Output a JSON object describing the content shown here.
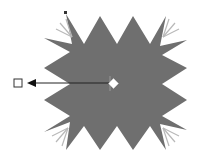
{
  "diagram": {
    "shape": {
      "type": "star-burst",
      "fill": "#6f6f6f",
      "points": "66,14 84,44 100,16 117,44 133,16 150,44 166,16 160,46 187,40 162,55 187,68 162,84 187,100 162,116 187,130 160,124 166,150 150,126 133,150 117,126 100,150 84,126 66,150 70,122 44,132 70,116 44,100 70,84 44,68 70,52 44,38 72,44"
    },
    "ghost_rays": {
      "color": "#b8b8b8",
      "corners": [
        {
          "name": "top-left",
          "x": 72,
          "y": 37
        },
        {
          "name": "top-right",
          "x": 163,
          "y": 37
        },
        {
          "name": "bottom-left",
          "x": 68,
          "y": 128
        },
        {
          "name": "bottom-right",
          "x": 163,
          "y": 128
        }
      ]
    },
    "center_handle": {
      "x": 114,
      "y": 84,
      "color": "#ffffff"
    },
    "top_handle": {
      "x": 66,
      "y": 14,
      "color": "#333333"
    },
    "connector": {
      "x1": 110,
      "y1": 83,
      "x2": 34,
      "y2": 83,
      "color": "#222222"
    },
    "target_box": {
      "x": 14,
      "y": 78,
      "size": 8,
      "stroke": "#333333"
    }
  }
}
